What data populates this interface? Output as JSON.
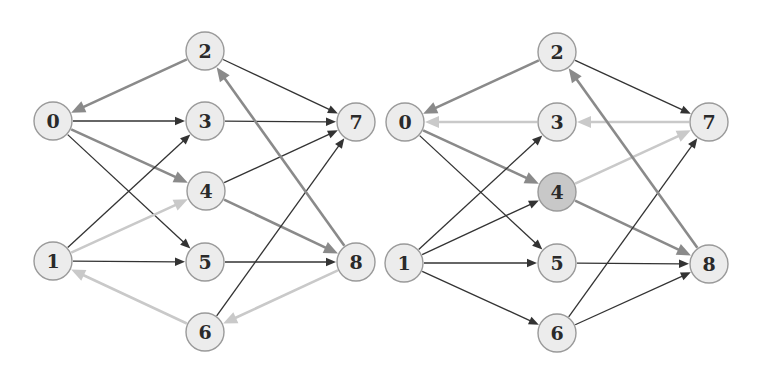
{
  "colors": {
    "dark": "#333333",
    "medium": "#8a8a8a",
    "light": "#c9c9c9",
    "node_fill": "#ececec",
    "node_fill_highlight": "#c8c8c8",
    "node_stroke": "#9a9a9a"
  },
  "node_radius": 19,
  "graphs": [
    {
      "id": "left-graph",
      "nodes": [
        {
          "id": "0",
          "label": "0",
          "x": 53,
          "y": 121
        },
        {
          "id": "1",
          "label": "1",
          "x": 53,
          "y": 261
        },
        {
          "id": "2",
          "label": "2",
          "x": 205,
          "y": 51
        },
        {
          "id": "3",
          "label": "3",
          "x": 205,
          "y": 121
        },
        {
          "id": "4",
          "label": "4",
          "x": 206,
          "y": 191
        },
        {
          "id": "5",
          "label": "5",
          "x": 205,
          "y": 262
        },
        {
          "id": "6",
          "label": "6",
          "x": 205,
          "y": 332
        },
        {
          "id": "7",
          "label": "7",
          "x": 356,
          "y": 122
        },
        {
          "id": "8",
          "label": "8",
          "x": 356,
          "y": 262
        }
      ],
      "edges": [
        {
          "from": "2",
          "to": "0",
          "style": "medium"
        },
        {
          "from": "2",
          "to": "7",
          "style": "dark"
        },
        {
          "from": "0",
          "to": "3",
          "style": "dark"
        },
        {
          "from": "3",
          "to": "7",
          "style": "dark"
        },
        {
          "from": "0",
          "to": "4",
          "style": "medium"
        },
        {
          "from": "0",
          "to": "5",
          "style": "dark"
        },
        {
          "from": "1",
          "to": "3",
          "style": "dark"
        },
        {
          "from": "1",
          "to": "4",
          "style": "light"
        },
        {
          "from": "1",
          "to": "5",
          "style": "dark"
        },
        {
          "from": "4",
          "to": "7",
          "style": "dark"
        },
        {
          "from": "4",
          "to": "8",
          "style": "medium"
        },
        {
          "from": "5",
          "to": "8",
          "style": "dark"
        },
        {
          "from": "6",
          "to": "7",
          "style": "dark"
        },
        {
          "from": "8",
          "to": "2",
          "style": "medium"
        },
        {
          "from": "8",
          "to": "6",
          "style": "light"
        },
        {
          "from": "6",
          "to": "1",
          "style": "light"
        }
      ]
    },
    {
      "id": "right-graph",
      "nodes": [
        {
          "id": "0",
          "label": "0",
          "x": 405,
          "y": 122
        },
        {
          "id": "1",
          "label": "1",
          "x": 404,
          "y": 263
        },
        {
          "id": "2",
          "label": "2",
          "x": 557,
          "y": 52
        },
        {
          "id": "3",
          "label": "3",
          "x": 557,
          "y": 122
        },
        {
          "id": "4",
          "label": "4",
          "x": 557,
          "y": 192,
          "highlight": true
        },
        {
          "id": "5",
          "label": "5",
          "x": 557,
          "y": 263
        },
        {
          "id": "6",
          "label": "6",
          "x": 557,
          "y": 333
        },
        {
          "id": "7",
          "label": "7",
          "x": 709,
          "y": 122
        },
        {
          "id": "8",
          "label": "8",
          "x": 709,
          "y": 264
        }
      ],
      "edges": [
        {
          "from": "2",
          "to": "0",
          "style": "medium"
        },
        {
          "from": "2",
          "to": "7",
          "style": "dark"
        },
        {
          "from": "3",
          "to": "0",
          "style": "light"
        },
        {
          "from": "7",
          "to": "3",
          "style": "light"
        },
        {
          "from": "0",
          "to": "4",
          "style": "medium"
        },
        {
          "from": "0",
          "to": "5",
          "style": "dark"
        },
        {
          "from": "1",
          "to": "3",
          "style": "dark"
        },
        {
          "from": "1",
          "to": "4",
          "style": "dark"
        },
        {
          "from": "1",
          "to": "5",
          "style": "dark"
        },
        {
          "from": "1",
          "to": "6",
          "style": "dark"
        },
        {
          "from": "4",
          "to": "7",
          "style": "light"
        },
        {
          "from": "4",
          "to": "8",
          "style": "medium"
        },
        {
          "from": "5",
          "to": "8",
          "style": "dark"
        },
        {
          "from": "6",
          "to": "7",
          "style": "dark"
        },
        {
          "from": "6",
          "to": "8",
          "style": "dark"
        },
        {
          "from": "8",
          "to": "2",
          "style": "medium"
        }
      ]
    }
  ]
}
